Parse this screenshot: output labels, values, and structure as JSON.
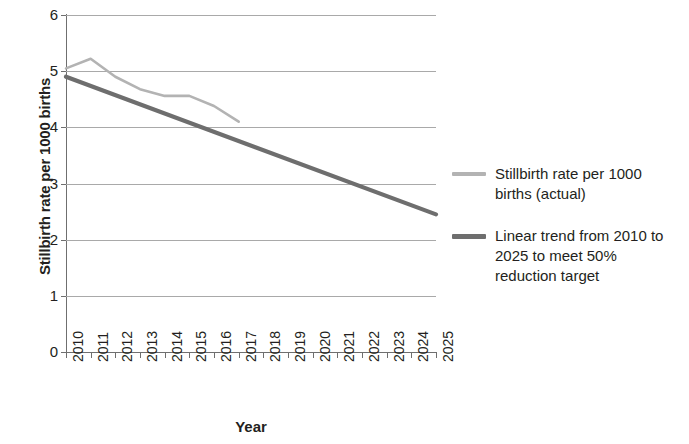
{
  "chart_data": {
    "type": "line",
    "title": "",
    "xlabel": "Year",
    "ylabel": "Stillbirth rate per 1000 births",
    "x": [
      2010,
      2011,
      2012,
      2013,
      2014,
      2015,
      2016,
      2017,
      2018,
      2019,
      2020,
      2021,
      2022,
      2023,
      2024,
      2025
    ],
    "xtick_labels": [
      "2010",
      "2011",
      "2012",
      "2013",
      "2014",
      "2015",
      "2016",
      "2017",
      "2018",
      "2019",
      "2020",
      "2021",
      "2022",
      "2023",
      "2024",
      "2025"
    ],
    "ytick_labels": [
      "0",
      "1",
      "2",
      "3",
      "4",
      "5",
      "6"
    ],
    "ytick_values": [
      0,
      1,
      2,
      3,
      4,
      5,
      6
    ],
    "xlim": [
      2010,
      2025
    ],
    "ylim": [
      0,
      6
    ],
    "grid": "horizontal",
    "legend_position": "right",
    "series": [
      {
        "name": "Stillbirth rate per 1000 births (actual)",
        "color": "#b3b3b3",
        "x": [
          2010,
          2011,
          2012,
          2013,
          2014,
          2015,
          2016,
          2017
        ],
        "values": [
          5.05,
          5.22,
          4.9,
          4.68,
          4.56,
          4.56,
          4.38,
          4.1
        ]
      },
      {
        "name": "Linear trend from 2010 to 2025 to meet 50% reduction target",
        "color": "#6e6e6e",
        "x": [
          2010,
          2025
        ],
        "values": [
          4.9,
          2.45
        ]
      }
    ],
    "legend": [
      {
        "label": "Stillbirth rate per 1000 births (actual)",
        "color": "#b3b3b3"
      },
      {
        "label": "Linear trend from 2010 to 2025 to meet 50% reduction target",
        "color": "#6e6e6e"
      }
    ],
    "colors": {
      "actual_line": "#b3b3b3",
      "trend_line": "#6e6e6e",
      "gridline": "#a9a9a9",
      "axis": "#6f6f6f",
      "text": "#231f20",
      "background": "#ffffff"
    }
  },
  "legend_text": {
    "actual_line_1": "Stillbirth rate per 1000",
    "actual_line_2": "births (actual)",
    "trend_line_1": "Linear trend from 2010 to",
    "trend_line_2": "2025 to meet 50%",
    "trend_line_3": "reduction target"
  }
}
